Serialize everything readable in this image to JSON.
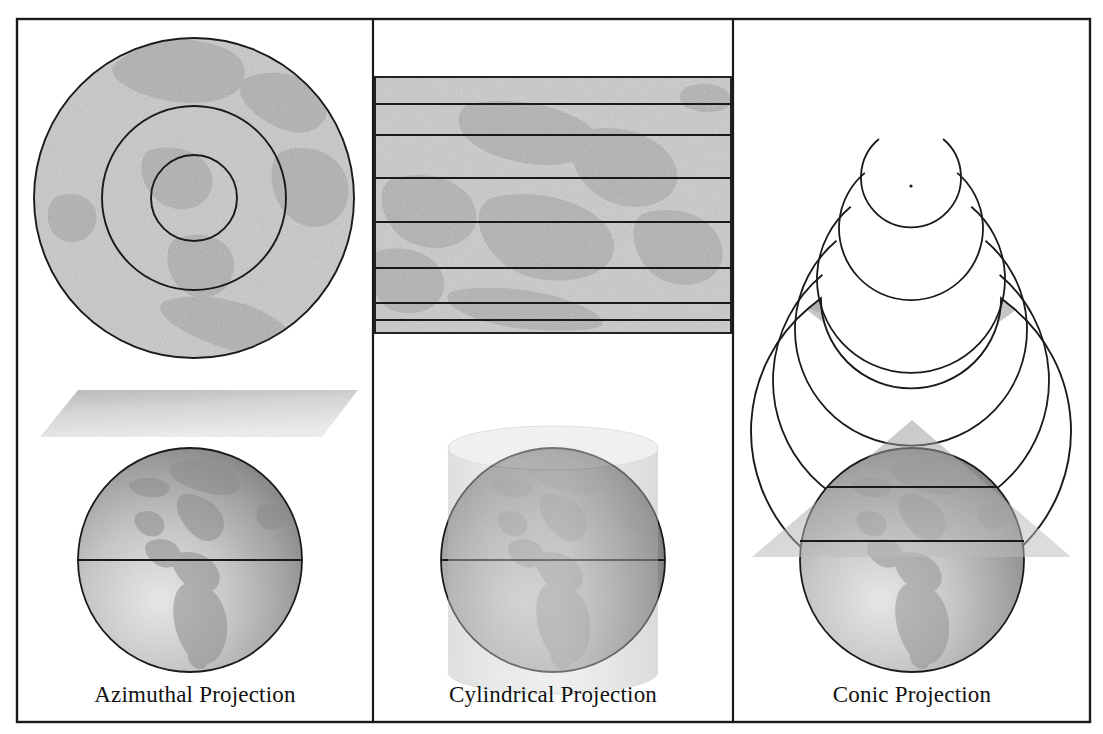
{
  "figure": {
    "background_color": "#ffffff",
    "frame": {
      "stroke_color": "#1a1a1a",
      "x": 17,
      "y": 19,
      "width": 1073,
      "height": 703
    },
    "dividers": [
      {
        "name": "divider-left",
        "x": 373
      },
      {
        "name": "divider-right",
        "x": 733
      }
    ]
  },
  "palette": {
    "map_fill": "#c9c9c9",
    "map_fill_dark": "#b3b3b3",
    "outline": "#1a1a1a",
    "globe_light": "#d8d8d8",
    "globe_mid": "#a8a8a8",
    "globe_dark": "#8a8a8a",
    "land": "#9a9a9a",
    "overlay": "#9e9e9e",
    "text": "#111111"
  },
  "panels": [
    {
      "id": "azimuthal",
      "caption": "Azimuthal Projection",
      "projection_shape": "concentric-circles",
      "developable_surface": "plane",
      "graticule_count": 3,
      "map": {
        "center_x": 194,
        "center_y": 198,
        "radii": [
          160,
          92,
          43
        ]
      },
      "diagram": {
        "globe_center_x": 190,
        "globe_center_y": 560,
        "globe_radius": 112,
        "plane": {
          "top": 390,
          "bottom": 437,
          "left": 40,
          "right": 358
        },
        "equator_y": 560
      }
    },
    {
      "id": "cylindrical",
      "caption": "Cylindrical Projection",
      "projection_shape": "rectangle-with-parallels",
      "developable_surface": "cylinder",
      "graticule_count": 8,
      "map": {
        "left": 375,
        "top": 77,
        "right": 731,
        "bottom": 333,
        "parallel_y": [
          77,
          104,
          135,
          178,
          222,
          268,
          303,
          320,
          333
        ]
      },
      "diagram": {
        "globe_center_x": 553,
        "globe_center_y": 560,
        "globe_radius": 112,
        "cylinder": {
          "left": 448,
          "right": 658,
          "top": 448,
          "bottom": 672
        },
        "equator_y": 560
      }
    },
    {
      "id": "conic",
      "caption": "Conic Projection",
      "projection_shape": "annular-sector",
      "developable_surface": "cone",
      "graticule_count": 6,
      "map": {
        "center_x": 911,
        "center_y": 186,
        "outer_radius": 160,
        "inner_radius": 20,
        "start_angle_deg": 50,
        "sweep_deg": 260,
        "arc_radii": [
          160,
          138,
          116,
          94,
          72,
          50
        ]
      },
      "diagram": {
        "globe_center_x": 912,
        "globe_center_y": 560,
        "globe_radius": 112,
        "cone": {
          "apex_x": 912,
          "apex_y": 420,
          "left_x": 752,
          "right_x": 1071,
          "base_y": 557
        },
        "parallel_y": [
          487,
          541
        ]
      }
    }
  ]
}
